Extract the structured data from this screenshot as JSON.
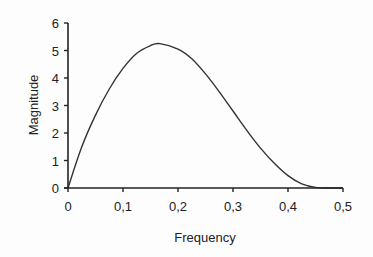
{
  "chart_data": {
    "type": "line",
    "title": "",
    "xlabel": "Frequency",
    "ylabel": "Magnitude",
    "xlim": [
      0,
      0.5
    ],
    "ylim": [
      0,
      6
    ],
    "grid": false,
    "legend": null,
    "x_ticks": [
      "0",
      "0,1",
      "0,2",
      "0,3",
      "0,4",
      "0,5"
    ],
    "y_ticks": [
      "0",
      "1",
      "2",
      "3",
      "4",
      "5",
      "6"
    ],
    "series": [
      {
        "name": "Magnitude",
        "color": "#333333",
        "x": [
          0,
          0.025,
          0.05,
          0.075,
          0.1,
          0.125,
          0.15,
          0.167,
          0.2,
          0.225,
          0.25,
          0.275,
          0.3,
          0.325,
          0.35,
          0.375,
          0.4,
          0.425,
          0.45,
          0.475,
          0.5
        ],
        "values": [
          0,
          1.5,
          2.65,
          3.6,
          4.35,
          4.9,
          5.18,
          5.25,
          5.05,
          4.7,
          4.15,
          3.5,
          2.8,
          2.1,
          1.45,
          0.9,
          0.45,
          0.15,
          0.02,
          0,
          0
        ]
      }
    ]
  }
}
